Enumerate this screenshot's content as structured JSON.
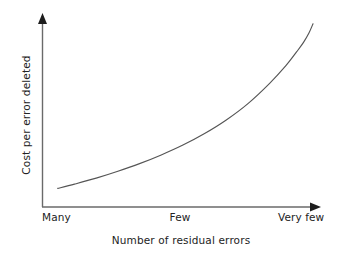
{
  "chart_data": {
    "type": "line",
    "title": "",
    "subtitle": "",
    "xlabel": "Number of residual errors",
    "ylabel": "Cost per error deleted",
    "grid": false,
    "legend": null,
    "legend_position": "none",
    "annotations": [],
    "x_tick_labels": [
      "Many",
      "Few",
      "Very few"
    ],
    "x_tick_positions": [
      0,
      0.5,
      1.0
    ],
    "y_tick_labels": [],
    "xlim": [
      0,
      1
    ],
    "ylim": [
      0,
      1
    ],
    "x_axis_direction": "Many to Very few (decreasing residual errors)",
    "series": [
      {
        "name": "Cost per error deleted",
        "color": "#555555",
        "style": "solid",
        "description": "Monotonically increasing convex (exponential) curve; cost per error deleted rises slowly while many residual errors remain, then climbs steeply as residual errors become very few.",
        "x": [
          0.058,
          0.12,
          0.2,
          0.28,
          0.36,
          0.44,
          0.52,
          0.6,
          0.68,
          0.76,
          0.84,
          0.9,
          0.94,
          0.965,
          0.985,
          1.0
        ],
        "y": [
          0.1,
          0.123,
          0.155,
          0.192,
          0.233,
          0.28,
          0.333,
          0.395,
          0.468,
          0.556,
          0.665,
          0.76,
          0.835,
          0.885,
          0.935,
          0.985
        ]
      }
    ]
  },
  "axes": {
    "y_axis": {
      "label": "Cost per error deleted",
      "arrow": "up-arrow-icon",
      "color": "#666666"
    },
    "x_axis": {
      "label": "Number of residual errors",
      "arrow": "right-arrow-icon",
      "color": "#666666"
    }
  },
  "colors": {
    "background": "#ffffff",
    "axis": "#666666",
    "curve": "#555555",
    "text": "#232323"
  }
}
